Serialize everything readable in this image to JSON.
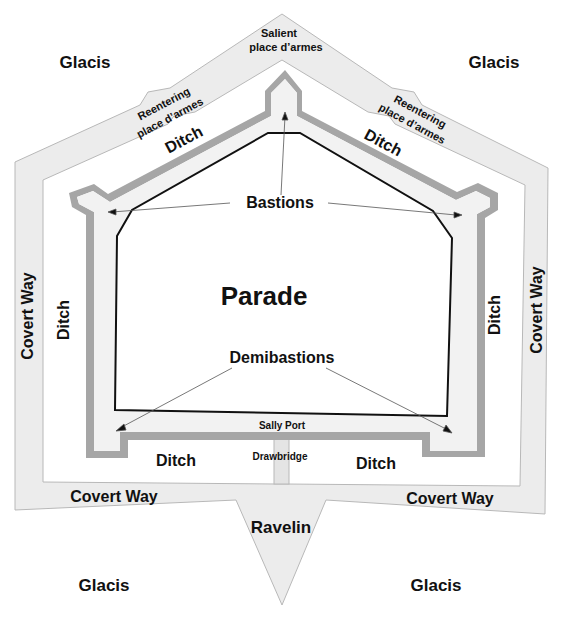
{
  "diagram": {
    "colors": {
      "background": "#ffffff",
      "covert_way_fill": "#ececec",
      "covert_way_stroke": "#b8b8b8",
      "rampart_gray": "#a6a6a6",
      "inner_fill": "#f2f2f2",
      "parade_stroke": "#111111",
      "arrow": "#555555"
    },
    "labels": {
      "glacis_top_left": "Glacis",
      "glacis_top_right": "Glacis",
      "glacis_bottom_left": "Glacis",
      "glacis_bottom_right": "Glacis",
      "salient_place_darmes_line1": "Salient",
      "salient_place_darmes_line2": "place d’armes",
      "reentering_left_line1": "Reentering",
      "reentering_left_line2": "place d’armes",
      "reentering_right_line1": "Reentering",
      "reentering_right_line2": "place d’armes",
      "ditch_top_left": "Ditch",
      "ditch_top_right": "Ditch",
      "ditch_left": "Ditch",
      "ditch_right": "Ditch",
      "ditch_bottom_left": "Ditch",
      "ditch_bottom_right": "Ditch",
      "covert_way_left": "Covert Way",
      "covert_way_right": "Covert Way",
      "covert_way_bottom_left": "Covert Way",
      "covert_way_bottom_right": "Covert Way",
      "bastions": "Bastions",
      "parade": "Parade",
      "demibastions": "Demibastions",
      "sally_port": "Sally Port",
      "drawbridge": "Drawbridge",
      "ravelin": "Ravelin"
    }
  }
}
